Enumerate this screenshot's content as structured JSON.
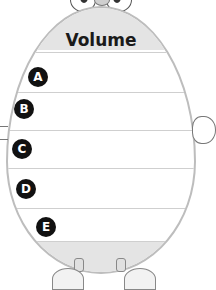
{
  "worksheet": {
    "title": "Volume",
    "rows": [
      {
        "label": "A",
        "value": ""
      },
      {
        "label": "B",
        "value": ""
      },
      {
        "label": "C",
        "value": ""
      },
      {
        "label": "D",
        "value": ""
      },
      {
        "label": "E",
        "value": ""
      }
    ]
  },
  "colors": {
    "band": "#e4e4e4",
    "outline": "#bdbdbd",
    "badge": "#111111"
  }
}
